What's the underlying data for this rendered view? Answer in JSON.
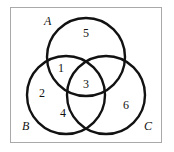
{
  "figure": {
    "type": "venn-diagram",
    "set_count": 3,
    "frame": {
      "border_color": "#a9a9a9",
      "background": "#ffffff"
    },
    "stroke_color": "#121212",
    "stroke_width": 2.4,
    "sets": [
      {
        "id": "A",
        "label": "A",
        "cx": 86,
        "cy": 57,
        "r": 39,
        "label_x": 44,
        "label_y": 21
      },
      {
        "id": "B",
        "label": "B",
        "cx": 66,
        "cy": 95,
        "r": 39,
        "label_x": 22,
        "label_y": 126
      },
      {
        "id": "C",
        "label": "C",
        "cx": 106,
        "cy": 95,
        "r": 39,
        "label_x": 144,
        "label_y": 126
      }
    ],
    "regions": [
      {
        "id": "r5",
        "label": "5",
        "region": "A only",
        "x": 86,
        "y": 33
      },
      {
        "id": "r1",
        "label": "1",
        "region": "A and B",
        "x": 61,
        "y": 68
      },
      {
        "id": "r3",
        "label": "3",
        "region": "A, B and C",
        "x": 86,
        "y": 84
      },
      {
        "id": "r2",
        "label": "2",
        "region": "B only",
        "x": 42,
        "y": 93
      },
      {
        "id": "r4",
        "label": "4",
        "region": "B and C",
        "x": 63,
        "y": 113
      },
      {
        "id": "r6",
        "label": "6",
        "region": "C only",
        "x": 126,
        "y": 105
      }
    ]
  }
}
